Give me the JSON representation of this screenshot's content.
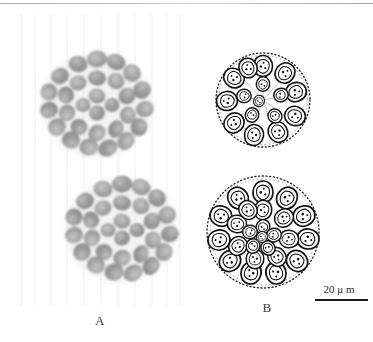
{
  "figure": {
    "panels": [
      {
        "id": "A",
        "label": "A",
        "kind": "light-micrograph",
        "description": "Two overlapping spheroidal colonies of tightly packed rounded cells, grayscale photomicrograph on pale streaked background",
        "colony_count": 2
      },
      {
        "id": "B",
        "label": "B",
        "kind": "line-drawing",
        "description": "Two ink line drawings of spherical colonies with teardrop-shaped cells arranged inside a stippled envelope",
        "colony_count": 2
      }
    ],
    "scalebar": {
      "label": "20 μ m",
      "value": 20,
      "unit": "μm"
    },
    "colors": {
      "background": "#ffffff",
      "ink": "#1a1a1a",
      "cell_gray": "#9a9a9a",
      "rule_gray": "#b4b4b4",
      "label_gray": "#3b3b3b"
    }
  }
}
